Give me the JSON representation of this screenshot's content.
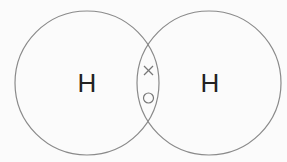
{
  "diagram": {
    "title": "",
    "atoms": [
      {
        "label": "H",
        "cx": 87,
        "cy": 83,
        "r": 72
      },
      {
        "label": "H",
        "cx": 209,
        "cy": 83,
        "r": 72
      }
    ],
    "shared_electrons": [
      {
        "symbol": "×",
        "owner": "left"
      },
      {
        "symbol": "○",
        "owner": "right"
      }
    ],
    "colors": {
      "circle_stroke": "#8a8a8a",
      "label": "#222222",
      "electron": "#666666",
      "background": "#fbfbfb"
    }
  }
}
